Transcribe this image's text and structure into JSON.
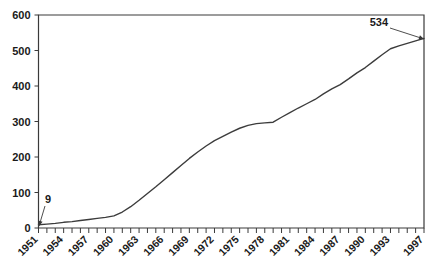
{
  "chart_data": {
    "type": "line",
    "title": "",
    "xlabel": "",
    "ylabel": "",
    "xlim": [
      1951,
      1997
    ],
    "ylim": [
      0,
      600
    ],
    "grid": false,
    "legend": null,
    "yticks": [
      0,
      100,
      200,
      300,
      400,
      500,
      600
    ],
    "ytick_labels": [
      "0",
      "100",
      "200",
      "300",
      "400",
      "500",
      "600"
    ],
    "xtick_labels": [
      "1951",
      "1954",
      "1957",
      "1960",
      "1963",
      "1966",
      "1969",
      "1972",
      "1975",
      "1978",
      "1981",
      "1984",
      "1987",
      "1990",
      "1993",
      "1997"
    ],
    "x": [
      1951,
      1952,
      1953,
      1954,
      1955,
      1956,
      1957,
      1958,
      1959,
      1960,
      1961,
      1962,
      1963,
      1964,
      1965,
      1966,
      1967,
      1968,
      1969,
      1970,
      1971,
      1972,
      1973,
      1974,
      1975,
      1976,
      1977,
      1978,
      1979,
      1980,
      1981,
      1982,
      1983,
      1984,
      1985,
      1986,
      1987,
      1988,
      1989,
      1990,
      1991,
      1992,
      1993,
      1994,
      1995,
      1996,
      1997
    ],
    "values": [
      9,
      11,
      13,
      16,
      18,
      21,
      24,
      27,
      30,
      34,
      45,
      60,
      78,
      97,
      116,
      136,
      156,
      176,
      196,
      214,
      231,
      246,
      258,
      270,
      281,
      289,
      294,
      296,
      298,
      312,
      325,
      338,
      350,
      362,
      378,
      392,
      404,
      420,
      437,
      452,
      470,
      488,
      505,
      513,
      520,
      527,
      534
    ],
    "annotations": [
      {
        "text": "9",
        "x": 1951,
        "y": 9,
        "label_px": {
          "x": 45,
          "y": 203
        },
        "point_px": {
          "x": 39,
          "y": 226
        },
        "arrow": true
      },
      {
        "text": "534",
        "x": 1997,
        "y": 534,
        "label_px": {
          "x": 388,
          "y": 26
        },
        "point_px": {
          "x": 424,
          "y": 39
        },
        "arrow": true
      }
    ],
    "colors": {
      "line": "#3c3c3c",
      "axis": "#3a3a3a",
      "background": "#ffffff",
      "text": "#1a1a1a"
    }
  }
}
